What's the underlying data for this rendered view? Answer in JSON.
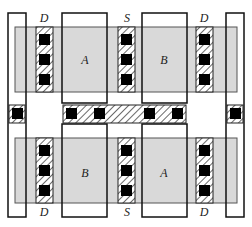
{
  "diagram": {
    "top_row": {
      "terminal_labels": [
        "D",
        "S",
        "D"
      ],
      "device_labels": [
        "A",
        "B"
      ]
    },
    "bottom_row": {
      "terminal_labels": [
        "D",
        "S",
        "D"
      ],
      "device_labels": [
        "B",
        "A"
      ]
    },
    "colors": {
      "active_fill": "#d9d9d9",
      "outline": "#111111",
      "contact": "#000000",
      "hatch": "#444444"
    }
  }
}
